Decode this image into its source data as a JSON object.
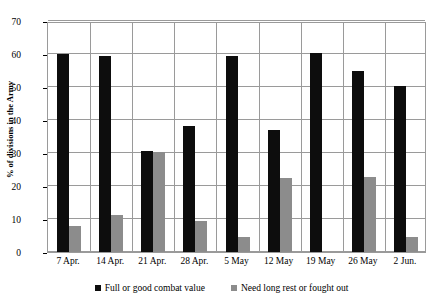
{
  "chart_data": {
    "type": "bar",
    "title": "",
    "xlabel": "",
    "ylabel": "% of divisions in the Army",
    "ylim": [
      0,
      70
    ],
    "yticks": [
      0,
      10,
      20,
      30,
      40,
      50,
      60,
      70
    ],
    "grid": true,
    "legend_position": "bottom",
    "categories": [
      "7 Apr.",
      "14 Apr.",
      "21 Apr.",
      "28 Apr.",
      "5 May",
      "12 May",
      "19 May",
      "26 May",
      "2 Jun."
    ],
    "series": [
      {
        "name": "Full or good combat value",
        "color": "#0d0d0d",
        "values": [
          60.0,
          59.4,
          30.5,
          38.1,
          59.3,
          37.1,
          60.4,
          54.8,
          50.3
        ]
      },
      {
        "name": "Need long rest or fought out",
        "color": "#8c8c8c",
        "values": [
          8.0,
          11.1,
          30.4,
          9.5,
          4.5,
          22.3,
          0,
          22.8,
          4.6
        ]
      }
    ]
  },
  "axis": {
    "y_title": "% of divisions in the Army",
    "y_tick_labels": [
      "70",
      "60",
      "50",
      "40",
      "30",
      "20",
      "10",
      "0"
    ],
    "x_tick_labels": [
      "7 Apr.",
      "14 Apr.",
      "21 Apr.",
      "28 Apr.",
      "5 May",
      "12 May",
      "19 May",
      "26 May",
      "2 Jun."
    ]
  },
  "legend": {
    "entries": [
      {
        "label": "Full or good combat value",
        "swatch": "black-square-marker"
      },
      {
        "label": "Need long rest or fought out",
        "swatch": "gray-square-marker"
      }
    ]
  },
  "colors": {
    "series_black": "#0d0d0d",
    "series_gray": "#8c8c8c",
    "gridline": "#9a9a9a",
    "background": "#ffffff",
    "text": "#000000"
  }
}
